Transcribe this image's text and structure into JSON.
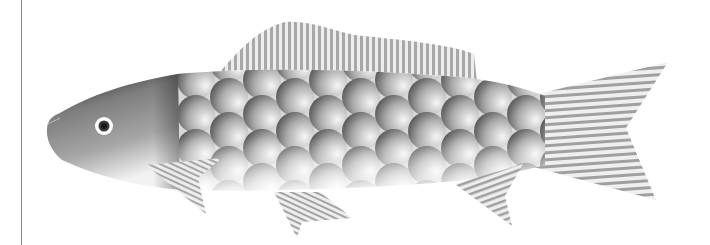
{
  "illustration": {
    "subject": "fish",
    "style": "grayscale halftone vector illustration",
    "colors": {
      "background": "#ffffff",
      "frame_line": "#8a8a8a",
      "head_dark": "#2a2a2a",
      "head_mid": "#8c8c8c",
      "scale_dark": "#5a5a5a",
      "scale_light": "#f4f4f4",
      "fin_stripe": "#9a9a9a",
      "eye_ring": "#ffffff",
      "eye_pupil": "#222222"
    },
    "parts": [
      "head",
      "eye",
      "body-scales",
      "dorsal-fin",
      "pectoral-fin",
      "pelvic-fin",
      "anal-fin",
      "tail-fin"
    ]
  }
}
